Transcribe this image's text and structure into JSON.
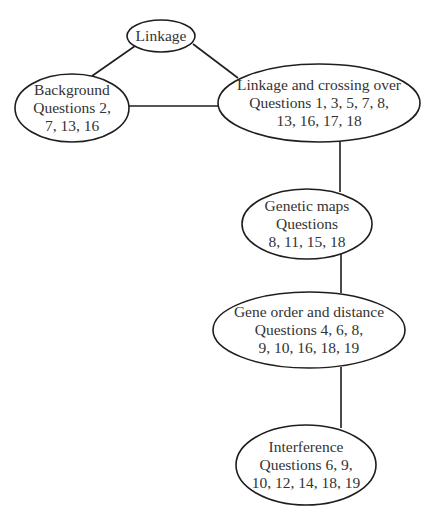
{
  "diagram": {
    "nodes": [
      {
        "id": "linkage",
        "lines": [
          "Linkage"
        ],
        "cx": 161,
        "cy": 36,
        "rx": 34,
        "ry": 16
      },
      {
        "id": "background",
        "lines": [
          "Background",
          "Questions 2,",
          "7, 13, 16"
        ],
        "cx": 72,
        "cy": 108,
        "rx": 57,
        "ry": 34
      },
      {
        "id": "linkage-crossing-over",
        "lines": [
          "Linkage and crossing over",
          "Questions 1, 3, 5, 7, 8,",
          "13, 16, 17, 18"
        ],
        "cx": 319,
        "cy": 103,
        "rx": 101,
        "ry": 39
      },
      {
        "id": "genetic-maps",
        "lines": [
          "Genetic maps",
          "Questions",
          "8, 11, 15, 18"
        ],
        "cx": 307,
        "cy": 224,
        "rx": 65,
        "ry": 35
      },
      {
        "id": "gene-order-distance",
        "lines": [
          "Gene order and distance",
          "Questions 4, 6, 8,",
          "9, 10, 16, 18, 19"
        ],
        "cx": 309,
        "cy": 330,
        "rx": 96,
        "ry": 38
      },
      {
        "id": "interference",
        "lines": [
          "Interference",
          "Questions 6, 9,",
          "10, 12, 14, 18, 19"
        ],
        "cx": 306,
        "cy": 465,
        "rx": 70,
        "ry": 40
      }
    ],
    "edges": [
      {
        "from": "linkage",
        "to": "background",
        "x1": 135,
        "y1": 46,
        "x2": 92,
        "y2": 76
      },
      {
        "from": "linkage",
        "to": "linkage-crossing-over",
        "x1": 193,
        "y1": 44,
        "x2": 238,
        "y2": 78
      },
      {
        "from": "background",
        "to": "linkage-crossing-over",
        "x1": 129,
        "y1": 106,
        "x2": 219,
        "y2": 106
      },
      {
        "from": "linkage-crossing-over",
        "to": "genetic-maps",
        "x1": 340,
        "y1": 141,
        "x2": 340,
        "y2": 192
      },
      {
        "from": "genetic-maps",
        "to": "gene-order-distance",
        "x1": 341,
        "y1": 254,
        "x2": 341,
        "y2": 293
      },
      {
        "from": "gene-order-distance",
        "to": "interference",
        "x1": 341,
        "y1": 367,
        "x2": 341,
        "y2": 428
      }
    ]
  }
}
